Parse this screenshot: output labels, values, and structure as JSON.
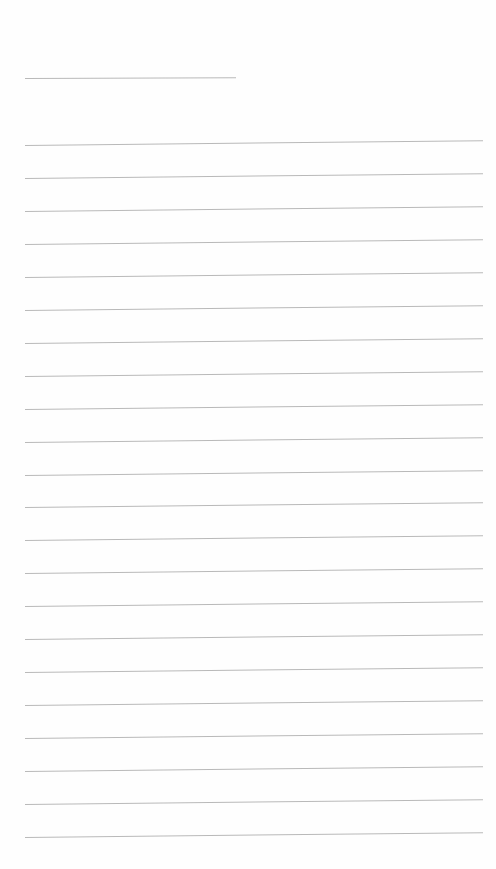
{
  "document": {
    "type": "lined-paper",
    "title_line": {
      "x": 25,
      "y": 78,
      "width": 211
    },
    "ruled_lines": {
      "count": 22,
      "start_y": 145,
      "spacing": 32.95,
      "x": 25,
      "width": 458,
      "color": "#b9b9b9"
    },
    "text_content": []
  }
}
